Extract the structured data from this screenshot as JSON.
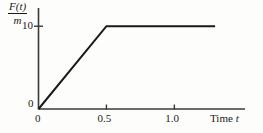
{
  "figure": {
    "name": "force-per-mass-vs-time",
    "background_color": "#fdfdfc",
    "line_color": "#1a1a1a",
    "axis_color": "#3a3a3a"
  },
  "yaxis": {
    "label_numerator": "F(t)",
    "label_denominator": "m",
    "origin_label": "0",
    "ticks": [
      {
        "value": 10,
        "label": "10"
      }
    ]
  },
  "xaxis": {
    "title_text": "Time",
    "title_variable": "t",
    "ticks": [
      {
        "value": 0,
        "label": "0"
      },
      {
        "value": 0.5,
        "label": "0.5"
      },
      {
        "value": 1.0,
        "label": "1.0"
      }
    ]
  },
  "chart_data": {
    "type": "line",
    "title": "",
    "subtitle": "",
    "xlabel": "Time t",
    "ylabel": "F(t)/m",
    "xlim": [
      0,
      1.52
    ],
    "ylim": [
      0,
      12.2
    ],
    "grid": false,
    "legend": null,
    "xticks": [
      0,
      0.5,
      1.0
    ],
    "xticklabels": [
      "0",
      "0.5",
      "1.0"
    ],
    "yticks": [
      0,
      10
    ],
    "yticklabels": [
      "0",
      "10"
    ],
    "series": [
      {
        "name": "F(t)/m",
        "color": "#1a1a1a",
        "linewidth": 2,
        "x": [
          0,
          0.5,
          1.3
        ],
        "y": [
          0,
          10,
          10
        ]
      }
    ],
    "annotations": [
      {
        "text": "ramp from origin to (0.5, 10)",
        "x": 0.25,
        "y": 5
      },
      {
        "text": "constant plateau at 10 after t = 0.5",
        "x": 0.9,
        "y": 10
      }
    ]
  }
}
